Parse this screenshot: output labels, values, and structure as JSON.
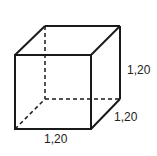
{
  "diagram": {
    "shape": "cube",
    "labels": {
      "height": "1,20",
      "depth": "1,20",
      "width": "1,20"
    },
    "colors": {
      "stroke": "#1a1a1a",
      "text": "#222222"
    }
  }
}
